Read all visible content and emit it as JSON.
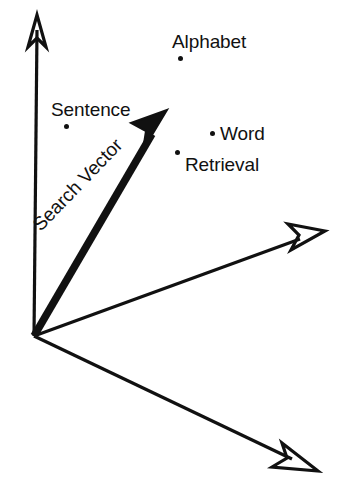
{
  "figure": {
    "background_color": "#ffffff",
    "ink_color": "#111111",
    "width": 345,
    "height": 492,
    "caption": ""
  },
  "axes": [
    {
      "name": "vertical-axis",
      "label": "",
      "arrowhead": "open-v",
      "from": [
        34,
        336
      ],
      "to": [
        37,
        20
      ]
    },
    {
      "name": "right-axis",
      "label": "",
      "arrowhead": "open-v",
      "from": [
        34,
        336
      ],
      "to": [
        322,
        232
      ]
    },
    {
      "name": "lower-right-axis",
      "label": "",
      "arrowhead": "open-v",
      "from": [
        34,
        336
      ],
      "to": [
        315,
        470
      ]
    }
  ],
  "vector": {
    "name": "Search Vector",
    "label": "Search Vector",
    "arrowhead": "solid",
    "from": [
      34,
      336
    ],
    "to": [
      165,
      112
    ],
    "label_rotation_deg": -46
  },
  "points": [
    {
      "id": "alphabet",
      "label": "Alphabet",
      "dot": [
        180,
        58
      ],
      "label_position": "above-right-of-dot"
    },
    {
      "id": "sentence",
      "label": "Sentence",
      "dot": [
        66,
        126
      ],
      "label_position": "above-right-of-dot"
    },
    {
      "id": "word",
      "label": "Word",
      "dot": [
        212,
        133
      ],
      "label_position": "right-of-dot"
    },
    {
      "id": "retrieval",
      "label": "Retrieval",
      "dot": [
        177,
        152
      ],
      "label_position": "right-of-dot"
    }
  ]
}
